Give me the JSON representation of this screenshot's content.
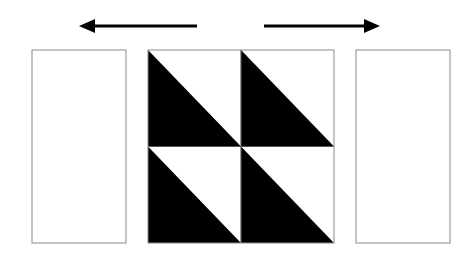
{
  "diagram": {
    "colors": {
      "background": "#ffffff",
      "fill": "#000000",
      "outline": "#8a8a8a",
      "grid_line": "#555555"
    },
    "arrows": [
      {
        "direction": "left",
        "x1": 197,
        "x2": 79,
        "y": 26
      },
      {
        "direction": "right",
        "x1": 264,
        "x2": 380,
        "y": 26
      }
    ],
    "left_panel": {
      "x": 32,
      "y": 50,
      "width": 94,
      "height": 193
    },
    "right_panel": {
      "x": 356,
      "y": 50,
      "width": 94,
      "height": 193
    },
    "center_block": {
      "x": 148,
      "y": 50,
      "width": 186,
      "height": 193,
      "rows": 2,
      "cols": 2,
      "cells": [
        {
          "row": 0,
          "col": 0,
          "dark_half": "bottom-left"
        },
        {
          "row": 0,
          "col": 1,
          "dark_half": "bottom-left"
        },
        {
          "row": 1,
          "col": 0,
          "dark_half": "bottom-left"
        },
        {
          "row": 1,
          "col": 1,
          "dark_half": "bottom-left"
        }
      ]
    }
  }
}
